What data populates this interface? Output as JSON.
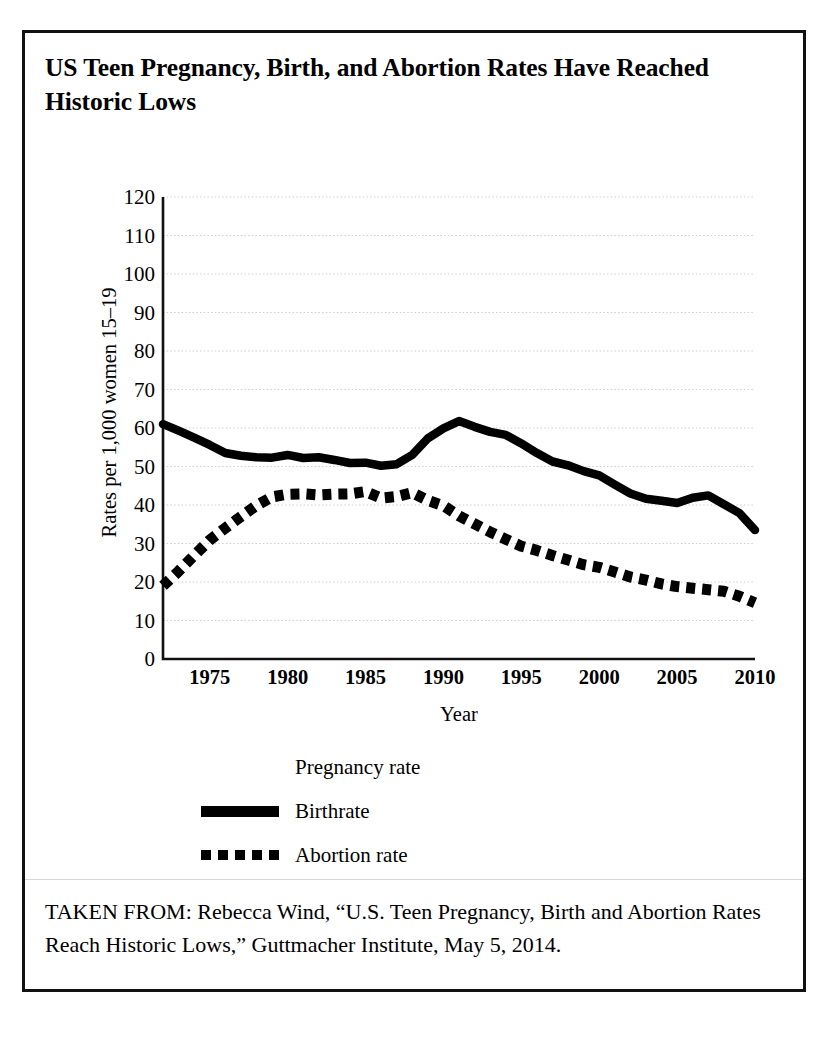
{
  "figure": {
    "title": "US Teen Pregnancy, Birth, and Abortion Rates Have Reached Historic Lows",
    "source_note": "TAKEN FROM: Rebecca Wind, “U.S. Teen Pregnancy, Birth and Abortion Rates Reach Historic Lows,” Guttmacher Institute, May 5, 2014."
  },
  "legend": {
    "position": "below-plot",
    "entries": [
      {
        "label": "Pregnancy rate",
        "style": "none",
        "swatch_visible": false
      },
      {
        "label": "Birthrate",
        "style": "solid",
        "swatch_visible": true
      },
      {
        "label": "Abortion rate",
        "style": "dotted",
        "swatch_visible": true
      }
    ]
  },
  "colors": {
    "ink": "#000000",
    "gridline": "#cfcfcf",
    "axis": "#111111",
    "page_border": "#111111"
  },
  "chart_data": {
    "type": "line",
    "title": "US Teen Pregnancy, Birth, and Abortion Rates Have Reached Historic Lows",
    "xlabel": "Year",
    "ylabel": "Rates per 1,000 women 15–19",
    "xlim": [
      1972,
      2010
    ],
    "ylim": [
      0,
      120
    ],
    "yticks": [
      0,
      10,
      20,
      30,
      40,
      50,
      60,
      70,
      80,
      90,
      100,
      110,
      120
    ],
    "xticks": [
      1975,
      1980,
      1985,
      1990,
      1995,
      2000,
      2005,
      2010
    ],
    "grid": true,
    "grid_axis": "y",
    "x": [
      1972,
      1973,
      1974,
      1975,
      1976,
      1977,
      1978,
      1979,
      1980,
      1981,
      1982,
      1983,
      1984,
      1985,
      1986,
      1987,
      1988,
      1989,
      1990,
      1991,
      1992,
      1993,
      1994,
      1995,
      1996,
      1997,
      1998,
      1999,
      2000,
      2001,
      2002,
      2003,
      2004,
      2005,
      2006,
      2007,
      2008,
      2009,
      2010
    ],
    "series": [
      {
        "name": "Birthrate",
        "style": "solid",
        "values": [
          61.0,
          59.3,
          57.5,
          55.6,
          53.5,
          52.8,
          52.4,
          52.3,
          53.0,
          52.2,
          52.4,
          51.7,
          50.9,
          51.0,
          50.2,
          50.6,
          53.0,
          57.3,
          59.9,
          61.8,
          60.3,
          59.0,
          58.2,
          56.0,
          53.5,
          51.3,
          50.3,
          48.8,
          47.7,
          45.3,
          43.0,
          41.6,
          41.1,
          40.5,
          41.9,
          42.5,
          40.2,
          37.9,
          33.5
        ]
      },
      {
        "name": "Abortion rate",
        "style": "dotted",
        "values": [
          19.0,
          22.8,
          26.9,
          30.9,
          34.0,
          37.0,
          39.9,
          42.1,
          42.8,
          42.9,
          42.6,
          42.8,
          42.9,
          43.5,
          41.8,
          42.2,
          43.2,
          41.2,
          39.8,
          37.2,
          35.1,
          33.0,
          31.1,
          29.3,
          28.2,
          26.9,
          25.7,
          24.5,
          23.8,
          22.6,
          21.3,
          20.5,
          19.5,
          18.8,
          18.4,
          18.0,
          17.6,
          16.3,
          14.6
        ]
      }
    ]
  }
}
